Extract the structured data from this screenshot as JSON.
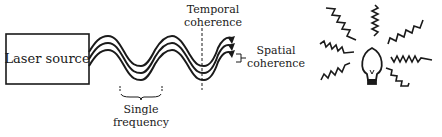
{
  "diagram": {
    "laser_box": {
      "label": "Laser source"
    },
    "labels": {
      "temporal_line1": "Temporal",
      "temporal_line2": "coherence",
      "spatial_line1": "Spatial",
      "spatial_line2": "coherence",
      "single_line1": "Single",
      "single_line2": "frequency"
    },
    "bulb": {
      "rays": 8
    },
    "colors": {
      "ink": "#1a1a1a",
      "background": "#ffffff"
    }
  }
}
